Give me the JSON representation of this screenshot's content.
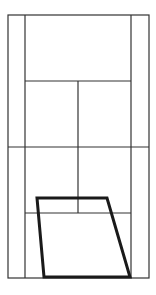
{
  "diagram": {
    "type": "tennis-court",
    "orientation": "vertical",
    "line_color": "#333333",
    "highlight_color": "#1a1a1a",
    "court": {
      "outer": {
        "x1": 8,
        "y1": 15,
        "x2": 149,
        "y2": 278
      },
      "singles_left_x": 25,
      "singles_right_x": 131,
      "net_y": 147,
      "service_top_y": 81,
      "service_bottom_y": 213,
      "center_x": 78
    },
    "highlight_region": {
      "label": "target-zone",
      "points": [
        [
          37,
          198
        ],
        [
          107,
          198
        ],
        [
          130,
          277
        ],
        [
          44,
          277
        ]
      ]
    }
  }
}
